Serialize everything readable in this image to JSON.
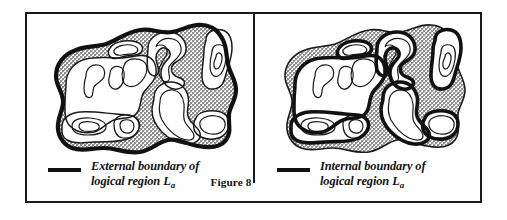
{
  "figure": {
    "label": "Figure 8",
    "panels": [
      {
        "id": "external",
        "legend_text_line1": "External boundary of",
        "legend_text_line2_prefix": "logical region ",
        "legend_text_line2_var": "L",
        "legend_text_line2_sub": "a",
        "legend_swatch": "thick-line-swatch",
        "emphasis": "external-boundary",
        "description": "Irregular blob region with stippled gray annulus and several white holes; the outer perimeter is drawn with a heavy stroke."
      },
      {
        "id": "internal",
        "legend_text_line1": "Internal boundary of",
        "legend_text_line2_prefix": "logical region ",
        "legend_text_line2_var": "L",
        "legend_text_line2_sub": "a",
        "legend_swatch": "thick-line-swatch",
        "emphasis": "internal-boundary",
        "description": "Same irregular blob region; here the boundaries of the interior white holes are drawn with a heavy stroke while the outer perimeter is thin."
      }
    ],
    "colors": {
      "ink": "#1a1a1a",
      "stipple_gray": "#9a9a9a",
      "paper": "#ffffff",
      "frame": "#1a1a1a"
    }
  }
}
